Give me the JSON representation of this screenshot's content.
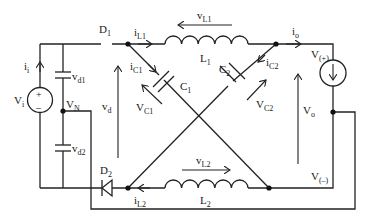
{
  "diagram": {
    "type": "circuit-schematic",
    "title": "",
    "components": {
      "source": {
        "name": "V",
        "sub": "i",
        "plus": "+",
        "minus": "–"
      },
      "cap_d1": {
        "name": "v",
        "sub": "d1"
      },
      "cap_d2": {
        "name": "v",
        "sub": "d2"
      },
      "node_n": {
        "name": "V",
        "sub": "N"
      },
      "diode1": {
        "name": "D",
        "sub": "1"
      },
      "diode2": {
        "name": "D",
        "sub": "2"
      },
      "inductor1": {
        "name": "L",
        "sub": "1"
      },
      "inductor2": {
        "name": "L",
        "sub": "2"
      },
      "cap1": {
        "name": "C",
        "sub": "1"
      },
      "cap2": {
        "name": "C",
        "sub": "2"
      },
      "load": {
        "name": "current-source-load"
      }
    },
    "labels": {
      "ii": {
        "name": "i",
        "sub": "i"
      },
      "vd": {
        "name": "v",
        "sub": "d"
      },
      "iL1": {
        "name": "i",
        "sub": "L1"
      },
      "vL1": {
        "name": "v",
        "sub": "L1"
      },
      "iC1": {
        "name": "i",
        "sub": "C1"
      },
      "VC1": {
        "name": "V",
        "sub": "C1"
      },
      "iC2": {
        "name": "i",
        "sub": "C2"
      },
      "VC2": {
        "name": "V",
        "sub": "C2"
      },
      "io": {
        "name": "i",
        "sub": "o"
      },
      "Vplus": {
        "name": "V",
        "sub": "(+)"
      },
      "Vo": {
        "name": "V",
        "sub": "o"
      },
      "Vminus": {
        "name": "V",
        "sub": "(–)"
      },
      "vL2": {
        "name": "v",
        "sub": "L2"
      },
      "iL2": {
        "name": "i",
        "sub": "L2"
      }
    }
  }
}
